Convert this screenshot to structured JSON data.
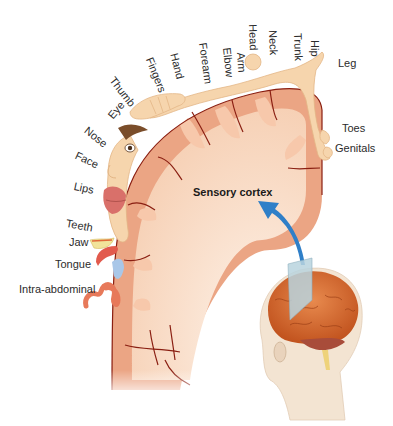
{
  "diagram": {
    "title": "Sensory cortex",
    "colors": {
      "cortex_outer": "#e9a07f",
      "cortex_inner": "#f6cfb3",
      "white_matter": "#fbe6d6",
      "sulcus": "#8a1f12",
      "skin": "#f5d2a8",
      "skin_shadow": "#e8b783",
      "lips": "#d9706a",
      "tongue": "#e25a4d",
      "arrow": "#2f7fc8",
      "brain": "#d9682e",
      "cerebellum": "#a84c3a",
      "head": "#f3e4d2",
      "plane": "#b9d3de"
    },
    "homunculus_labels": [
      {
        "name": "label-thumb",
        "text": "Thumb"
      },
      {
        "name": "label-fingers",
        "text": "Fingers"
      },
      {
        "name": "label-hand",
        "text": "Hand"
      },
      {
        "name": "label-forearm",
        "text": "Forearm"
      },
      {
        "name": "label-elbow",
        "text": "Elbow"
      },
      {
        "name": "label-arm",
        "text": "Arm"
      },
      {
        "name": "label-head",
        "text": "Head"
      },
      {
        "name": "label-neck",
        "text": "Neck"
      },
      {
        "name": "label-trunk",
        "text": "Trunk"
      },
      {
        "name": "label-hip",
        "text": "Hip"
      },
      {
        "name": "label-leg",
        "text": "Leg"
      },
      {
        "name": "label-toes",
        "text": "Toes"
      },
      {
        "name": "label-genitals",
        "text": "Genitals"
      },
      {
        "name": "label-eye",
        "text": "Eye"
      },
      {
        "name": "label-nose",
        "text": "Nose"
      },
      {
        "name": "label-face",
        "text": "Face"
      },
      {
        "name": "label-lips",
        "text": "Lips"
      },
      {
        "name": "label-teeth",
        "text": "Teeth"
      },
      {
        "name": "label-jaw",
        "text": "Jaw"
      },
      {
        "name": "label-tongue",
        "text": "Tongue"
      },
      {
        "name": "label-intra-abdominal",
        "text": "Intra-abdominal"
      }
    ]
  }
}
